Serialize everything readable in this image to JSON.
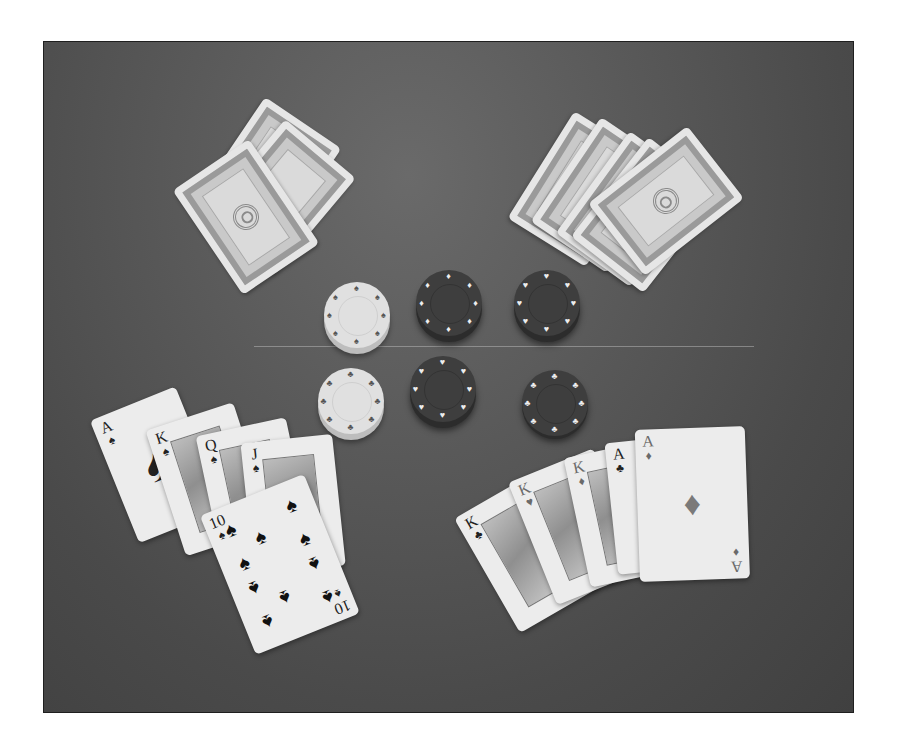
{
  "scene": {
    "description": "Grayscale photograph of a poker table with two face-down card hands, six poker chip stacks, and two face-up hands",
    "background_color": "#555555",
    "frame_border_color": "#1f1f1f"
  },
  "face_down_hands": {
    "left": {
      "card_count": 3,
      "label": "face-down cards top left"
    },
    "right": {
      "card_count": 5,
      "label": "face-down cards top right"
    }
  },
  "chips": [
    {
      "position": "top-left",
      "tone": "light"
    },
    {
      "position": "top-center",
      "tone": "dark"
    },
    {
      "position": "top-right",
      "tone": "dark"
    },
    {
      "position": "bottom-left",
      "tone": "light"
    },
    {
      "position": "bottom-center",
      "tone": "dark"
    },
    {
      "position": "bottom-right",
      "tone": "dark"
    }
  ],
  "hands": {
    "left": {
      "name": "Royal flush in spades",
      "cards": [
        {
          "rank": "A",
          "suit": "♠"
        },
        {
          "rank": "K",
          "suit": "♠"
        },
        {
          "rank": "Q",
          "suit": "♠"
        },
        {
          "rank": "J",
          "suit": "♠"
        },
        {
          "rank": "10",
          "suit": "♠"
        }
      ]
    },
    "right": {
      "name": "Full house, kings over aces",
      "cards": [
        {
          "rank": "K",
          "suit": "♣"
        },
        {
          "rank": "K",
          "suit": "♥"
        },
        {
          "rank": "K",
          "suit": "♦"
        },
        {
          "rank": "A",
          "suit": "♣"
        },
        {
          "rank": "A",
          "suit": "♦"
        }
      ]
    }
  }
}
